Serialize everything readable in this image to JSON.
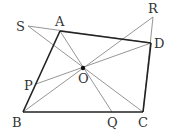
{
  "diagram": {
    "type": "geometry",
    "points": {
      "A": {
        "label": "A",
        "x": 60,
        "y": 31
      },
      "B": {
        "label": "B",
        "x": 23,
        "y": 112
      },
      "C": {
        "label": "C",
        "x": 143,
        "y": 112
      },
      "D": {
        "label": "D",
        "x": 151,
        "y": 43
      },
      "O": {
        "label": "O",
        "x": 83,
        "y": 68
      },
      "P": {
        "label": "P",
        "x": 36,
        "y": 84
      },
      "Q": {
        "label": "Q",
        "x": 112,
        "y": 112
      },
      "R": {
        "label": "R",
        "x": 153,
        "y": 17
      },
      "S": {
        "label": "S",
        "x": 28,
        "y": 26
      }
    },
    "thick_segments": [
      [
        "A",
        "B"
      ],
      [
        "B",
        "C"
      ],
      [
        "C",
        "D"
      ],
      [
        "D",
        "A"
      ]
    ],
    "thin_segments": [
      [
        "S",
        "D"
      ],
      [
        "S",
        "C"
      ],
      [
        "A",
        "Q"
      ],
      [
        "B",
        "R"
      ],
      [
        "R",
        "C"
      ],
      [
        "P",
        "D"
      ]
    ],
    "colors": {
      "thick": "#222222",
      "thin": "#888888",
      "text": "#333333"
    }
  }
}
